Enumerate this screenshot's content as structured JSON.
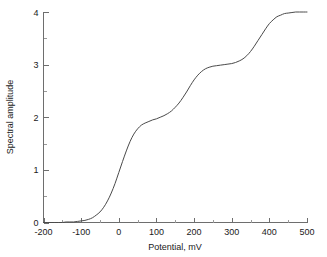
{
  "chart_data": {
    "type": "line",
    "title": "",
    "xlabel": "Potential, mV",
    "ylabel": "Spectral amplitude",
    "xlim": [
      -200,
      500
    ],
    "ylim": [
      0,
      4
    ],
    "xticks": [
      -200,
      -100,
      0,
      100,
      200,
      300,
      400,
      500
    ],
    "xtick_labels": [
      "-200",
      "-100",
      "0",
      "100",
      "200",
      "300",
      "400",
      "500"
    ],
    "xminor_step": 50,
    "yticks": [
      0,
      1,
      2,
      3,
      4
    ],
    "ytick_labels": [
      "0",
      "1",
      "2",
      "3",
      "4"
    ],
    "yminor_step": 0.5,
    "grid": false,
    "legend": null,
    "series": [
      {
        "name": "spectral amplitude",
        "color": "#4a4a4a",
        "x": [
          -200,
          -190,
          -180,
          -170,
          -160,
          -150,
          -140,
          -130,
          -120,
          -110,
          -100,
          -90,
          -80,
          -70,
          -60,
          -50,
          -40,
          -30,
          -20,
          -10,
          0,
          10,
          20,
          30,
          40,
          50,
          60,
          70,
          80,
          90,
          100,
          110,
          120,
          130,
          140,
          150,
          160,
          170,
          180,
          190,
          200,
          210,
          220,
          230,
          240,
          250,
          260,
          270,
          280,
          290,
          300,
          310,
          320,
          330,
          340,
          350,
          360,
          370,
          380,
          390,
          400,
          410,
          420,
          430,
          440,
          450,
          460,
          470,
          480,
          490,
          500
        ],
        "y": [
          0.0,
          0.0,
          0.0,
          0.0,
          0.0,
          0.0,
          0.01,
          0.01,
          0.01,
          0.02,
          0.03,
          0.04,
          0.06,
          0.09,
          0.14,
          0.2,
          0.29,
          0.41,
          0.56,
          0.74,
          0.95,
          1.16,
          1.36,
          1.54,
          1.68,
          1.78,
          1.85,
          1.89,
          1.92,
          1.95,
          1.97,
          2.0,
          2.03,
          2.07,
          2.12,
          2.19,
          2.27,
          2.37,
          2.48,
          2.6,
          2.71,
          2.8,
          2.87,
          2.92,
          2.95,
          2.97,
          2.98,
          2.99,
          3.0,
          3.01,
          3.02,
          3.04,
          3.07,
          3.11,
          3.17,
          3.25,
          3.35,
          3.46,
          3.57,
          3.68,
          3.78,
          3.85,
          3.91,
          3.94,
          3.97,
          3.98,
          3.99,
          4.0,
          4.0,
          4.0,
          4.0
        ]
      }
    ]
  },
  "axes": {
    "y_axis_label": "Spectral amplitude",
    "x_axis_label": "Potential, mV"
  }
}
